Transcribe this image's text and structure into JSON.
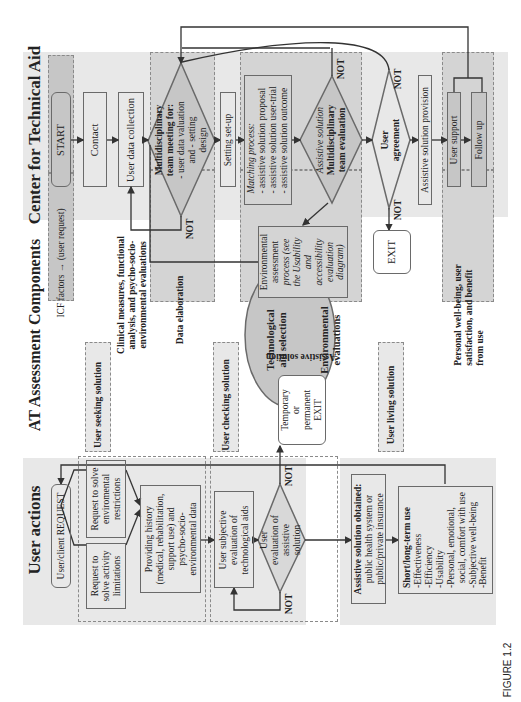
{
  "figure_label": "FIGURE 1.2",
  "lanes": {
    "center": {
      "title": "Center for Technical Aid"
    },
    "at": {
      "title": "AT Assessment Components"
    },
    "user": {
      "title": "User actions"
    }
  },
  "center": {
    "start": "START",
    "contact": "Contact",
    "user_data_collection": "User data collection",
    "team_meeting": [
      "Multidisciplinary",
      "team meeting for:",
      "- user data valuation",
      "and - setting",
      "design"
    ],
    "setting_setup": "Setting set-up",
    "matching_process": {
      "title": "Matching process:",
      "items": [
        "- assistive solution proposal",
        "- assistive solution user-trial",
        "- assistive solution outcome"
      ]
    },
    "team_evaluation": [
      "Assistive solution",
      "Multidisciplinary",
      "team evaluation"
    ],
    "user_agreement": [
      "User",
      "agreement"
    ],
    "provision": "Assistive solution provision",
    "user_support": "User support",
    "follow_up": "Follow up",
    "exit": "EXIT",
    "not_labels": [
      "NOT",
      "NOT",
      "NOT",
      "NOT"
    ]
  },
  "at": {
    "icf": "ICF factors → (user request)",
    "clinical": [
      "Clinical measures, functional",
      "analysis, and psycho-socio-",
      "environmental evaluations"
    ],
    "data_elaboration": "Data elaboration",
    "environmental_process": [
      "Environmental",
      "assessment",
      "process (see",
      "the Usability",
      "and",
      "accessibility",
      "evaluation",
      "diagram)"
    ],
    "tech_aid_selection": [
      "Technological",
      "aid selection"
    ],
    "environmental_evaluations": [
      "Environmental",
      "evaluations"
    ],
    "assistive_solution": "Assistive solution",
    "personal": [
      "Personal well-being, user",
      "satisfaction, and benefit",
      "from use"
    ],
    "temp_exit": [
      "Temporary",
      "or",
      "permanent",
      "EXIT"
    ]
  },
  "stages": {
    "seeking": "User seeking solution",
    "checking": "User checking solution",
    "living": "User living solution"
  },
  "user": {
    "request": "User/client REQUEST",
    "activity": [
      "Request to",
      "solve activity",
      "limitations"
    ],
    "environmental": [
      "Request to solve",
      "enviromental",
      "restrictions"
    ],
    "history": [
      "Providing history",
      "(medical, rehabilitation,",
      "support use) and",
      "psycho-socio-",
      "environmental data"
    ],
    "subjective": [
      "User subjective",
      "evaluation of",
      "technological aids"
    ],
    "evaluation": [
      "User",
      "evaluation of",
      "assistive",
      "solution"
    ],
    "obtained": {
      "title": "Assistive solution obtained:",
      "lines": [
        "public health system or",
        "public/private insurance"
      ]
    },
    "longterm": {
      "title": "Short/long-term use",
      "items": [
        "-Effectiveness",
        "-Efficiency",
        "-Usability",
        "-Personal, emotional,",
        "  social, comfort with use",
        "-Subjective well-being",
        "-Benefit"
      ]
    },
    "not_labels": [
      "NOT",
      "NOT"
    ]
  }
}
